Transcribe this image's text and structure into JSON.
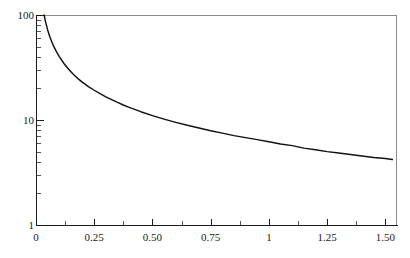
{
  "chart_data": {
    "type": "line",
    "title": "",
    "subtitle": "",
    "xlabel": "",
    "ylabel": "",
    "yscale": "log",
    "xscale": "linear",
    "xlim": [
      0,
      1.55
    ],
    "ylim": [
      1,
      100
    ],
    "grid": false,
    "legend": null,
    "x_ticks": [
      {
        "value": 0,
        "label": "0",
        "type": "major"
      },
      {
        "value": 0.125,
        "label": "",
        "type": "minor"
      },
      {
        "value": 0.25,
        "label": "0.25",
        "type": "major"
      },
      {
        "value": 0.375,
        "label": "",
        "type": "minor"
      },
      {
        "value": 0.5,
        "label": "0.50",
        "type": "major"
      },
      {
        "value": 0.625,
        "label": "",
        "type": "minor"
      },
      {
        "value": 0.75,
        "label": "0.75",
        "type": "major"
      },
      {
        "value": 0.875,
        "label": "",
        "type": "minor"
      },
      {
        "value": 1,
        "label": "1",
        "type": "major"
      },
      {
        "value": 1.125,
        "label": "",
        "type": "minor"
      },
      {
        "value": 1.25,
        "label": "1.25",
        "type": "major"
      },
      {
        "value": 1.375,
        "label": "",
        "type": "minor"
      },
      {
        "value": 1.5,
        "label": "1.50",
        "type": "major"
      }
    ],
    "y_ticks": [
      {
        "value": 100,
        "label": "100",
        "type": "major"
      },
      {
        "value": 90,
        "label": "",
        "type": "minor"
      },
      {
        "value": 80,
        "label": "",
        "type": "minor"
      },
      {
        "value": 70,
        "label": "",
        "type": "minor"
      },
      {
        "value": 60,
        "label": "",
        "type": "minor"
      },
      {
        "value": 50,
        "label": "",
        "type": "minor"
      },
      {
        "value": 40,
        "label": "",
        "type": "minor"
      },
      {
        "value": 30,
        "label": "",
        "type": "minor"
      },
      {
        "value": 20,
        "label": "",
        "type": "minor"
      },
      {
        "value": 10,
        "label": "10",
        "type": "major"
      },
      {
        "value": 9,
        "label": "",
        "type": "minor"
      },
      {
        "value": 8,
        "label": "",
        "type": "minor"
      },
      {
        "value": 7,
        "label": "",
        "type": "minor"
      },
      {
        "value": 6,
        "label": "",
        "type": "minor"
      },
      {
        "value": 5,
        "label": "",
        "type": "minor"
      },
      {
        "value": 4,
        "label": "",
        "type": "minor"
      },
      {
        "value": 3,
        "label": "",
        "type": "minor"
      },
      {
        "value": 2,
        "label": "",
        "type": "minor"
      },
      {
        "value": 1,
        "label": "1",
        "type": "major"
      }
    ],
    "series": [
      {
        "name": "curve",
        "color": "#111111",
        "x": [
          0.035,
          0.04,
          0.05,
          0.06,
          0.07,
          0.08,
          0.09,
          0.1,
          0.12,
          0.14,
          0.16,
          0.18,
          0.2,
          0.225,
          0.25,
          0.275,
          0.3,
          0.325,
          0.35,
          0.375,
          0.4,
          0.45,
          0.5,
          0.55,
          0.6,
          0.65,
          0.7,
          0.75,
          0.8,
          0.85,
          0.9,
          0.95,
          1.0,
          1.05,
          1.1,
          1.15,
          1.2,
          1.25,
          1.3,
          1.35,
          1.4,
          1.45,
          1.5,
          1.53
        ],
        "y": [
          100.0,
          90.5,
          75.6,
          65.2,
          57.7,
          52.0,
          47.5,
          43.8,
          38.2,
          34.1,
          31.0,
          28.5,
          26.4,
          24.2,
          22.4,
          20.9,
          19.6,
          18.5,
          17.5,
          16.7,
          15.9,
          14.6,
          13.5,
          12.6,
          11.8,
          11.2,
          10.6,
          10.1,
          9.6,
          9.2,
          8.8,
          8.5,
          8.2,
          7.9,
          7.7,
          7.4,
          7.2,
          7.0,
          6.8,
          6.6,
          6.5,
          6.3,
          6.2,
          6.1
        ],
        "rendered_y": [
          100.0,
          88.0,
          72.0,
          61.5,
          54.0,
          48.3,
          43.8,
          40.1,
          34.5,
          30.4,
          27.3,
          24.8,
          22.8,
          20.8,
          19.2,
          17.8,
          16.6,
          15.6,
          14.7,
          13.9,
          13.2,
          12.0,
          11.0,
          10.2,
          9.5,
          8.9,
          8.4,
          7.9,
          7.5,
          7.1,
          6.8,
          6.5,
          6.2,
          5.9,
          5.7,
          5.4,
          5.2,
          5.0,
          4.85,
          4.7,
          4.55,
          4.4,
          4.3,
          4.2
        ],
        "approx_function": "y = 4 / x^0.84"
      }
    ],
    "annotations": [],
    "notable_points": [
      {
        "x": 0.25,
        "y": 18.5
      },
      {
        "x": 0.5,
        "y": 9.2
      },
      {
        "x": 0.75,
        "y": 5.5
      },
      {
        "x": 1.0,
        "y": 4.0
      },
      {
        "x": 1.53,
        "y": 2.06
      }
    ]
  },
  "colors": {
    "curve": "#111111",
    "axis": "#1a1a1a",
    "frame": "#8a8a8a",
    "background": "#ffffff",
    "tick_minor": "#555555"
  }
}
